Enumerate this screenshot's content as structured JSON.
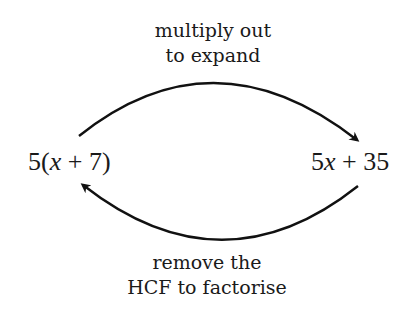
{
  "diagram": {
    "top_label": {
      "line1": "multiply out",
      "line2": "to expand"
    },
    "bottom_label": {
      "line1": "remove the",
      "line2": "HCF to factorise"
    },
    "left_expression": {
      "coef": "5(",
      "var": "x",
      "rest": " + 7)"
    },
    "right_expression": {
      "coef": "5",
      "var": "x",
      "rest": " + 35"
    },
    "arrows": [
      {
        "from": "left_expression",
        "to": "right_expression",
        "label": "top_label"
      },
      {
        "from": "right_expression",
        "to": "left_expression",
        "label": "bottom_label"
      }
    ],
    "stroke_color": "#111111"
  }
}
